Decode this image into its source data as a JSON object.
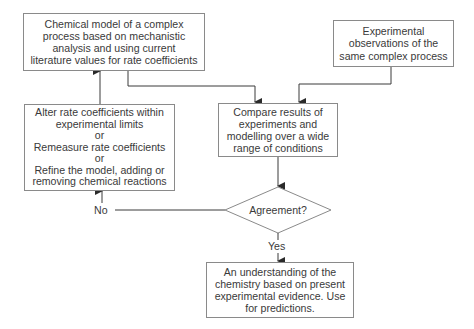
{
  "diagram": {
    "type": "flowchart",
    "nodes": {
      "model": {
        "lines": [
          "Chemical model of a complex",
          "process based on mechanistic",
          "analysis and using current",
          "literature values for rate coefficients"
        ]
      },
      "observations": {
        "lines": [
          "Experimental",
          "observations of the",
          "same complex process"
        ]
      },
      "compare": {
        "lines": [
          "Compare results of",
          "experiments and",
          "modelling over a wide",
          "range of conditions"
        ]
      },
      "alter": {
        "lines": [
          "Alter rate coefficients within",
          "experimental limits",
          "or",
          "Remeasure rate coefficients",
          "or",
          "Refine the model, adding or",
          "removing chemical reactions"
        ]
      },
      "decision": {
        "label": "Agreement?"
      },
      "understanding": {
        "lines": [
          "An understanding of the",
          "chemistry based on present",
          "experimental evidence.  Use",
          "for predictions."
        ]
      }
    },
    "edge_labels": {
      "no": "No",
      "yes": "Yes"
    },
    "edges": [
      {
        "from": "model",
        "to": "compare"
      },
      {
        "from": "observations",
        "to": "compare"
      },
      {
        "from": "compare",
        "to": "decision"
      },
      {
        "from": "decision",
        "to": "alter",
        "label": "No"
      },
      {
        "from": "alter",
        "to": "model"
      },
      {
        "from": "decision",
        "to": "understanding",
        "label": "Yes"
      }
    ],
    "colors": {
      "line": "#3a3a3a",
      "border": "#8a8a8a",
      "text": "#3a3a3a"
    }
  }
}
